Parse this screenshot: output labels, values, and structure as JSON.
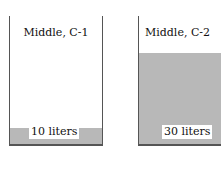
{
  "containers": [
    {
      "label": "Middle, C-1",
      "volume": "10 liters",
      "fill_height_px": 16,
      "fill_color": "#b8b8b8"
    },
    {
      "label": "Middle, C-2",
      "volume": "30 liters",
      "fill_height_px": 91,
      "fill_color": "#b8b8b8"
    }
  ]
}
